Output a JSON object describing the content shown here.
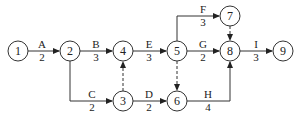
{
  "diagram": {
    "type": "activity-on-arrow network",
    "nodes": [
      {
        "id": "1",
        "label": "1",
        "x": 18,
        "y": 51
      },
      {
        "id": "2",
        "label": "2",
        "x": 70,
        "y": 51
      },
      {
        "id": "3",
        "label": "3",
        "x": 123,
        "y": 101
      },
      {
        "id": "4",
        "label": "4",
        "x": 123,
        "y": 51
      },
      {
        "id": "5",
        "label": "5",
        "x": 177,
        "y": 51
      },
      {
        "id": "6",
        "label": "6",
        "x": 177,
        "y": 101
      },
      {
        "id": "7",
        "label": "7",
        "x": 230,
        "y": 16
      },
      {
        "id": "8",
        "label": "8",
        "x": 230,
        "y": 51
      },
      {
        "id": "9",
        "label": "9",
        "x": 283,
        "y": 51
      }
    ],
    "activities": [
      {
        "name": "A",
        "duration": "2",
        "from": "1",
        "to": "2"
      },
      {
        "name": "B",
        "duration": "3",
        "from": "2",
        "to": "4"
      },
      {
        "name": "C",
        "duration": "2",
        "from": "2",
        "to": "3"
      },
      {
        "name": "D",
        "duration": "2",
        "from": "3",
        "to": "6"
      },
      {
        "name": "E",
        "duration": "3",
        "from": "4",
        "to": "5"
      },
      {
        "name": "F",
        "duration": "3",
        "from": "5",
        "to": "7"
      },
      {
        "name": "G",
        "duration": "2",
        "from": "5",
        "to": "8"
      },
      {
        "name": "H",
        "duration": "4",
        "from": "6",
        "to": "8"
      },
      {
        "name": "I",
        "duration": "3",
        "from": "8",
        "to": "9"
      }
    ],
    "dummy_activities": [
      {
        "from": "3",
        "to": "4"
      },
      {
        "from": "5",
        "to": "6"
      },
      {
        "from": "7",
        "to": "8"
      }
    ]
  }
}
